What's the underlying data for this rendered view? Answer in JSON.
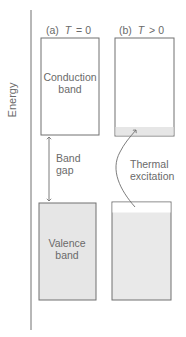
{
  "axis": {
    "label": "Energy"
  },
  "panels": [
    {
      "id": "a",
      "heading_prefix": "(a)",
      "heading_var": "T",
      "heading_rel": "= 0",
      "conduction_label_line1": "Conduction",
      "conduction_label_line2": "band",
      "valence_label_line1": "Valence",
      "valence_label_line2": "band"
    },
    {
      "id": "b",
      "heading_prefix": "(b)",
      "heading_var": "T",
      "heading_rel": "> 0"
    }
  ],
  "band_gap": {
    "line1": "Band",
    "line2": "gap"
  },
  "thermal": {
    "line1": "Thermal",
    "line2": "excitation"
  },
  "colors": {
    "box_stroke": "#707070",
    "fill_shaded": "#e6e6e6",
    "text": "#6a6a6a",
    "axis": "#707070"
  }
}
